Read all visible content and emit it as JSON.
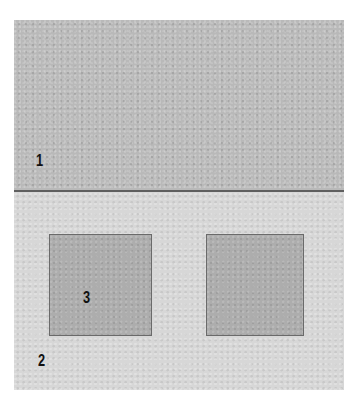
{
  "figure": {
    "colors": {
      "region_top": "#b9b9b9",
      "region_bottom": "#d7d7d7",
      "squares": "#adadad",
      "divider": "#5f5f5f",
      "label_text": "#111111"
    },
    "labels": {
      "region_top": "1",
      "region_bottom": "2",
      "square_left": "3"
    }
  }
}
